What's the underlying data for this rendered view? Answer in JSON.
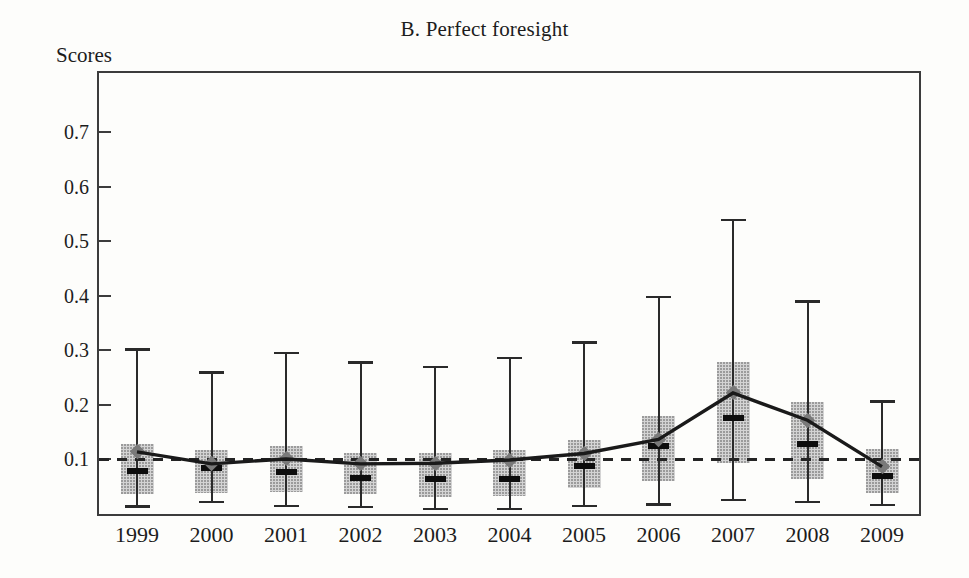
{
  "chart_data": {
    "type": "box-whisker-line",
    "title": "B. Perfect foresight",
    "ylabel": "Scores",
    "xlabel": "",
    "categories": [
      "1999",
      "2000",
      "2001",
      "2002",
      "2003",
      "2004",
      "2005",
      "2006",
      "2007",
      "2008",
      "2009"
    ],
    "ylim": [
      0,
      0.809
    ],
    "yticks": [
      0.1,
      0.2,
      0.3,
      0.4,
      0.5,
      0.6,
      0.7
    ],
    "ytick_labels": [
      "0.1",
      "0.2",
      "0.3",
      "0.4",
      "0.5",
      "0.6",
      "0.7"
    ],
    "grid": false,
    "legend": "none",
    "reference_line_y": 0.1,
    "series": [
      {
        "name": "mean-line-with-diamond-markers",
        "type": "line",
        "values": [
          0.114,
          0.092,
          0.101,
          0.092,
          0.093,
          0.099,
          0.111,
          0.137,
          0.222,
          0.172,
          0.087
        ]
      }
    ],
    "boxes": [
      {
        "category": "1999",
        "whisker_low": 0.014,
        "box_low": 0.037,
        "median": 0.078,
        "mean": 0.114,
        "box_high": 0.128,
        "whisker_high": 0.302
      },
      {
        "category": "2000",
        "whisker_low": 0.022,
        "box_low": 0.038,
        "median": 0.084,
        "mean": 0.092,
        "box_high": 0.117,
        "whisker_high": 0.26
      },
      {
        "category": "2001",
        "whisker_low": 0.015,
        "box_low": 0.04,
        "median": 0.077,
        "mean": 0.101,
        "box_high": 0.124,
        "whisker_high": 0.296
      },
      {
        "category": "2002",
        "whisker_low": 0.013,
        "box_low": 0.037,
        "median": 0.066,
        "mean": 0.092,
        "box_high": 0.112,
        "whisker_high": 0.278
      },
      {
        "category": "2003",
        "whisker_low": 0.009,
        "box_low": 0.031,
        "median": 0.064,
        "mean": 0.093,
        "box_high": 0.112,
        "whisker_high": 0.27
      },
      {
        "category": "2004",
        "whisker_low": 0.009,
        "box_low": 0.033,
        "median": 0.064,
        "mean": 0.099,
        "box_high": 0.117,
        "whisker_high": 0.287
      },
      {
        "category": "2005",
        "whisker_low": 0.015,
        "box_low": 0.048,
        "median": 0.088,
        "mean": 0.111,
        "box_high": 0.136,
        "whisker_high": 0.315
      },
      {
        "category": "2006",
        "whisker_low": 0.018,
        "box_low": 0.061,
        "median": 0.124,
        "mean": 0.137,
        "box_high": 0.18,
        "whisker_high": 0.398
      },
      {
        "category": "2007",
        "whisker_low": 0.026,
        "box_low": 0.094,
        "median": 0.176,
        "mean": 0.222,
        "box_high": 0.279,
        "whisker_high": 0.54
      },
      {
        "category": "2008",
        "whisker_low": 0.022,
        "box_low": 0.065,
        "median": 0.128,
        "mean": 0.172,
        "box_high": 0.206,
        "whisker_high": 0.39
      },
      {
        "category": "2009",
        "whisker_low": 0.017,
        "box_low": 0.038,
        "median": 0.07,
        "mean": 0.087,
        "box_high": 0.119,
        "whisker_high": 0.207
      }
    ],
    "colors": {
      "box_fill": "#d4d4d4",
      "box_stipple": "#9b9b9b",
      "whisker": "#2a2a2a",
      "median": "#0d0d0d",
      "mean_marker": "#7a7a7a",
      "line": "#1a1a1a",
      "reference_dash": "#242424",
      "frame": "#3c3c3c"
    }
  }
}
